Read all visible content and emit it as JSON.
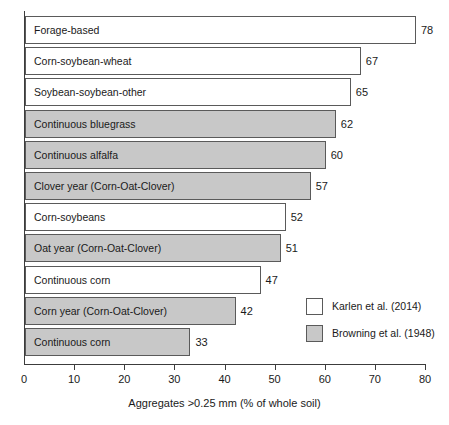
{
  "chart_data": {
    "type": "bar",
    "orientation": "horizontal",
    "title": "",
    "xlabel": "Aggregates >0.25 mm (% of whole soil)",
    "ylabel": "",
    "xlim": [
      0,
      80
    ],
    "xticks": [
      0,
      10,
      20,
      30,
      40,
      50,
      60,
      70,
      80
    ],
    "grid": false,
    "legend_position": "inside-right-lower",
    "colors": {
      "karlen_fill": "#ffffff",
      "browning_fill": "#c8c8c8",
      "outline": "#5a5a5a",
      "axis": "#3c3c3c",
      "text": "#1a1a1a"
    },
    "series": [
      {
        "name": "Karlen et al. (2014)",
        "fill": "#ffffff"
      },
      {
        "name": "Browning et al. (1948)",
        "fill": "#c8c8c8"
      }
    ],
    "categories": [
      "Forage-based",
      "Corn-soybean-wheat",
      "Soybean-soybean-other",
      "Continuous bluegrass",
      "Continuous alfalfa",
      "Clover year (Corn-Oat-Clover)",
      "Corn-soybeans",
      "Oat year (Corn-Oat-Clover)",
      "Continuous corn",
      "Corn year (Corn-Oat-Clover)",
      "Continuous corn"
    ],
    "values": [
      78,
      67,
      65,
      62,
      60,
      57,
      52,
      51,
      47,
      42,
      33
    ],
    "bars": [
      {
        "label": "Forage-based",
        "value": 78,
        "series": "Karlen et al. (2014)",
        "style": "white"
      },
      {
        "label": "Corn-soybean-wheat",
        "value": 67,
        "series": "Karlen et al. (2014)",
        "style": "white"
      },
      {
        "label": "Soybean-soybean-other",
        "value": 65,
        "series": "Karlen et al. (2014)",
        "style": "white"
      },
      {
        "label": "Continuous bluegrass",
        "value": 62,
        "series": "Browning et al. (1948)",
        "style": "gray"
      },
      {
        "label": "Continuous alfalfa",
        "value": 60,
        "series": "Browning et al. (1948)",
        "style": "gray"
      },
      {
        "label": "Clover year (Corn-Oat-Clover)",
        "value": 57,
        "series": "Browning et al. (1948)",
        "style": "gray"
      },
      {
        "label": "Corn-soybeans",
        "value": 52,
        "series": "Karlen et al. (2014)",
        "style": "white"
      },
      {
        "label": "Oat year (Corn-Oat-Clover)",
        "value": 51,
        "series": "Browning et al. (1948)",
        "style": "gray"
      },
      {
        "label": "Continuous corn",
        "value": 47,
        "series": "Karlen et al. (2014)",
        "style": "white"
      },
      {
        "label": "Corn year (Corn-Oat-Clover)",
        "value": 42,
        "series": "Browning et al. (1948)",
        "style": "gray"
      },
      {
        "label": "Continuous corn",
        "value": 33,
        "series": "Browning et al. (1948)",
        "style": "gray"
      }
    ],
    "legend": [
      {
        "label": "Karlen et al. (2014)",
        "style": "white"
      },
      {
        "label": "Browning et al. (1948)",
        "style": "gray"
      }
    ]
  }
}
